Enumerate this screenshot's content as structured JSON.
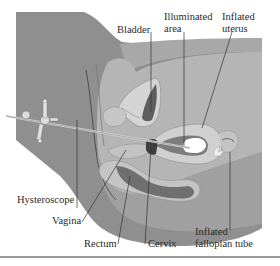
{
  "figure": {
    "type": "anatomical-illustration",
    "colors": {
      "background_tissue": "#8f8f8f",
      "body_outline_fill": "#a9a9a9",
      "abdominal_wall": "#b8b8b8",
      "organ_light": "#cfcfcf",
      "organ_mid": "#9c9c9c",
      "organ_dark": "#6e6e6e",
      "bladder_inner": "#5e5e5e",
      "illuminated": "#ffffff",
      "rule": "#9a9a9a"
    }
  },
  "labels": {
    "bladder": "Bladder",
    "illuminated_line1": "Illuminated",
    "illuminated_line2": "area",
    "inflated_uterus_line1": "Inflated",
    "inflated_uterus_line2": "uterus",
    "hysteroscope": "Hysteroscope",
    "vagina": "Vagina",
    "rectum": "Rectum",
    "cervix": "Cervix",
    "inflated_tube_line1": "Inflated",
    "inflated_tube_line2": "fallopian tube"
  }
}
